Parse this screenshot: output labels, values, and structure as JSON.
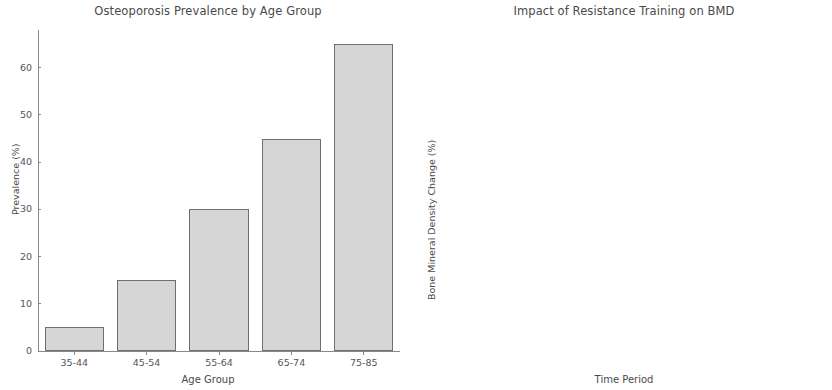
{
  "chart_data": [
    {
      "type": "bar",
      "title": "Osteoporosis Prevalence by Age Group",
      "xlabel": "Age Group",
      "ylabel": "Prevalence (%)",
      "categories": [
        "35-44",
        "45-54",
        "55-64",
        "65-74",
        "75-85"
      ],
      "values": [
        5,
        15,
        30,
        45,
        65
      ],
      "yticks": [
        0,
        10,
        20,
        30,
        40,
        50,
        60
      ],
      "ylim": [
        0,
        68
      ],
      "grid": false,
      "bar_color": "#d6d6d6",
      "bar_edge_color": "#6f6f6f"
    },
    {
      "type": "line",
      "title": "Impact of Resistance Training on BMD",
      "xlabel": "Time Period",
      "ylabel": "Bone Mineral Density Change (%)",
      "categories": [
        "0 months",
        "3 months",
        "6 months",
        "12 months"
      ],
      "values": [
        0,
        2,
        4,
        7
      ],
      "yticks": [
        0,
        1,
        2,
        3,
        4,
        5,
        6,
        7
      ],
      "ylim": [
        -0.15,
        7.3
      ],
      "grid": false,
      "line_color": "#7f7f7f",
      "marker": "circle",
      "marker_color": "#7f7f7f"
    }
  ]
}
